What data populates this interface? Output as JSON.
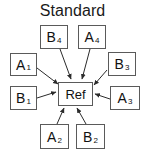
{
  "diagram": {
    "title": "Standard",
    "center": {
      "id": "ref",
      "label": "Ref"
    },
    "nodes": [
      {
        "id": "b4",
        "base": "B",
        "sub": "4",
        "label": "B4",
        "position": "top-left"
      },
      {
        "id": "a4",
        "base": "A",
        "sub": "4",
        "label": "A4",
        "position": "top-right"
      },
      {
        "id": "a1",
        "base": "A",
        "sub": "1",
        "label": "A1",
        "position": "left-upper"
      },
      {
        "id": "b1",
        "base": "B",
        "sub": "1",
        "label": "B1",
        "position": "left-lower"
      },
      {
        "id": "b3",
        "base": "B",
        "sub": "3",
        "label": "B3",
        "position": "right-upper"
      },
      {
        "id": "a3",
        "base": "A",
        "sub": "3",
        "label": "A3",
        "position": "right-lower"
      },
      {
        "id": "a2",
        "base": "A",
        "sub": "2",
        "label": "A2",
        "position": "bottom-left"
      },
      {
        "id": "b2",
        "base": "B",
        "sub": "2",
        "label": "B2",
        "position": "bottom-right"
      }
    ],
    "edges": [
      {
        "from": "b4",
        "to": "ref",
        "direction": "inward"
      },
      {
        "from": "a4",
        "to": "ref",
        "direction": "inward"
      },
      {
        "from": "a1",
        "to": "ref",
        "direction": "inward"
      },
      {
        "from": "b1",
        "to": "ref",
        "direction": "inward"
      },
      {
        "from": "b3",
        "to": "ref",
        "direction": "inward"
      },
      {
        "from": "a3",
        "to": "ref",
        "direction": "inward"
      },
      {
        "from": "a2",
        "to": "ref",
        "direction": "inward"
      },
      {
        "from": "b2",
        "to": "ref",
        "direction": "inward"
      }
    ],
    "colors": {
      "background": "#ffffff",
      "box_border": "#5a5a5a",
      "text": "#111111",
      "edge": "#2b2b2b"
    }
  }
}
